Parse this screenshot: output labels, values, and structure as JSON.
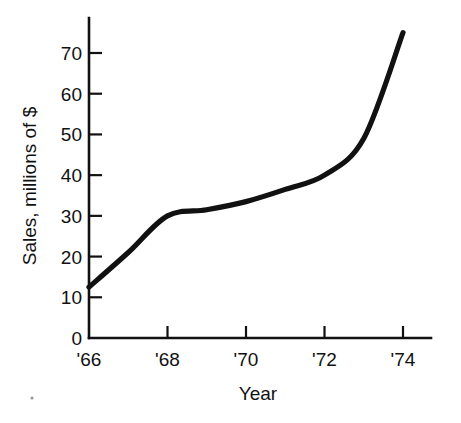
{
  "chart_data": {
    "type": "line",
    "title": "",
    "xlabel": "Year",
    "ylabel": "Sales, millions of $",
    "x": [
      1966,
      1967,
      1968,
      1969,
      1970,
      1971,
      1972,
      1973,
      1974
    ],
    "values": [
      12.5,
      21,
      30,
      31.5,
      33.5,
      36.5,
      40,
      49,
      75
    ],
    "series": [
      {
        "name": "Sales",
        "values": [
          12.5,
          21,
          30,
          31.5,
          33.5,
          36.5,
          40,
          49,
          75
        ]
      }
    ],
    "x_tick_labels": [
      "'66",
      "'68",
      "'70",
      "'72",
      "'74"
    ],
    "x_tick_values": [
      1966,
      1968,
      1970,
      1972,
      1974
    ],
    "y_tick_labels": [
      "0",
      "10",
      "20",
      "30",
      "40",
      "50",
      "60",
      "70"
    ],
    "y_tick_values": [
      0,
      10,
      20,
      30,
      40,
      50,
      60,
      70
    ],
    "xlim": [
      1966,
      1974.7
    ],
    "ylim": [
      0,
      77
    ],
    "grid": false,
    "legend": "none",
    "line_color": "#111111"
  },
  "axes": {
    "x_axis_label": "Year",
    "y_axis_label": "Sales, millions of $"
  },
  "ticks": {
    "y": [
      {
        "label": "70",
        "value": 70
      },
      {
        "label": "60",
        "value": 60
      },
      {
        "label": "50",
        "value": 50
      },
      {
        "label": "40",
        "value": 40
      },
      {
        "label": "30",
        "value": 30
      },
      {
        "label": "20",
        "value": 20
      },
      {
        "label": "10",
        "value": 10
      },
      {
        "label": "0",
        "value": 0
      }
    ],
    "x": [
      {
        "label": "'66",
        "value": 1966
      },
      {
        "label": "'68",
        "value": 1968
      },
      {
        "label": "'70",
        "value": 1970
      },
      {
        "label": "'72",
        "value": 1972
      },
      {
        "label": "'74",
        "value": 1974
      }
    ]
  }
}
